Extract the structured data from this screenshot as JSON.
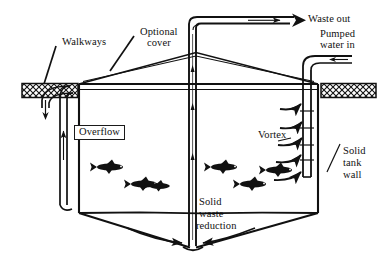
{
  "figure": {
    "background_color": "#ffffff",
    "line_color": "#111111"
  },
  "labels": {
    "walkways": "Walkways",
    "optional_cover_line1": "Optional",
    "optional_cover_line2": "cover",
    "waste_out": "Waste out",
    "pumped_line1": "Pumped",
    "pumped_line2": "water in",
    "overflow": "Overflow",
    "vortex": "Vortex",
    "solid_tank_wall_line1": "Solid",
    "solid_tank_wall_line2": "tank",
    "solid_tank_wall_line3": "wall",
    "solid_waste_line1": "Solid",
    "solid_waste_line2": "waste",
    "solid_waste_line3": "reduction"
  },
  "components": {
    "tank_wall": "solid-tank-wall",
    "cover": "optional-peaked-cover",
    "center_standpipe": "center-standpipe",
    "waste_pipe": "waste-out-pipe",
    "inlet_pipe": "pumped-water-inlet-pipe",
    "overflow_pipe": "overflow-standpipe",
    "left_walkway": "left-walkway-hatched",
    "right_walkway": "right-walkway-hatched",
    "conical_bottom": "conical-tank-bottom",
    "fish_count": 6,
    "vortex_arrow_count": 5
  },
  "flow_arrows": {
    "waste_out_direction": "right",
    "overflow_discharge_direction": "down",
    "inlet_direction": "left",
    "standpipe_flow_direction": "up",
    "overflow_riser_direction": "up"
  }
}
